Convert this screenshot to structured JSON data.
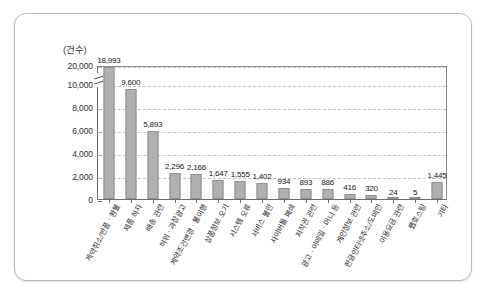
{
  "chart_data": {
    "type": "bar",
    "title": "",
    "subtitle": "",
    "xlabel": "",
    "ylabel": "",
    "unit_caption": "(건수)",
    "categories": [
      "계약취소/반품ㆍ환불",
      "제품 하자",
      "배송 관련",
      "허위ㆍ과장광고",
      "계약조건변경ㆍ불이행",
      "상품정보 오기",
      "시스템 오류",
      "서비스 불만",
      "사이버몰 폐쇄",
      "저작권 관련",
      "광고ㆍ이메일ㆍ머니 등",
      "개인정보 관련",
      "한글인터넷주소/도메인",
      "이용요금 관련",
      "웹호스팅",
      "기타"
    ],
    "values": [
      18993,
      9600,
      5893,
      2296,
      2166,
      1647,
      1555,
      1402,
      934,
      893,
      886,
      416,
      320,
      24,
      5,
      1445
    ],
    "value_labels": [
      "18,993",
      "9,600",
      "5,893",
      "2,296",
      "2,166",
      "1,647",
      "1,555",
      "1,402",
      "934",
      "893",
      "886",
      "416",
      "320",
      "24",
      "5",
      "1,445"
    ],
    "ytick_labels": [
      "0",
      "2,000",
      "4,000",
      "6,000",
      "8,000",
      "10,000",
      "20,000"
    ],
    "ytick_values": [
      0,
      2000,
      4000,
      6000,
      8000,
      10000,
      20000
    ],
    "ylim": [
      0,
      20000
    ],
    "axis_break": true,
    "axis_break_between": [
      10000,
      20000
    ],
    "grid": true,
    "grid_style": "dashed",
    "legend": "none",
    "colors": {
      "bar_fill": "#b0b0b0",
      "bar_edge": "#8f8f8f",
      "grid": "#c3c3c3",
      "axis": "#6d6d6d",
      "text": "#2b2b2b",
      "frame": "#b9b9b9",
      "background": "#ffffff"
    }
  }
}
